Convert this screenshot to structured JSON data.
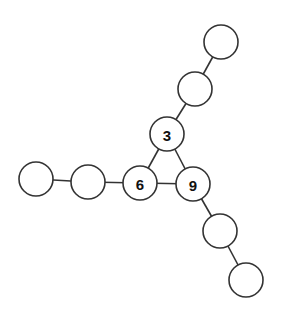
{
  "diagram": {
    "type": "graph",
    "node_radius": 17,
    "colors": {
      "stroke": "#333333",
      "fill": "#ffffff",
      "text": "#111111"
    },
    "nodes": [
      {
        "id": "n3",
        "label": "3",
        "x": 167,
        "y": 134
      },
      {
        "id": "n6",
        "label": "6",
        "x": 140,
        "y": 183
      },
      {
        "id": "n9",
        "label": "9",
        "x": 193,
        "y": 184
      },
      {
        "id": "t1",
        "label": "",
        "x": 195,
        "y": 89
      },
      {
        "id": "t2",
        "label": "",
        "x": 221,
        "y": 42
      },
      {
        "id": "l1",
        "label": "",
        "x": 88,
        "y": 182
      },
      {
        "id": "l2",
        "label": "",
        "x": 36,
        "y": 179
      },
      {
        "id": "b1",
        "label": "",
        "x": 220,
        "y": 231
      },
      {
        "id": "b2",
        "label": "",
        "x": 246,
        "y": 280
      }
    ],
    "edges": [
      [
        "n3",
        "n6"
      ],
      [
        "n3",
        "n9"
      ],
      [
        "n6",
        "n9"
      ],
      [
        "n3",
        "t1"
      ],
      [
        "t1",
        "t2"
      ],
      [
        "n6",
        "l1"
      ],
      [
        "l1",
        "l2"
      ],
      [
        "n9",
        "b1"
      ],
      [
        "b1",
        "b2"
      ]
    ]
  }
}
